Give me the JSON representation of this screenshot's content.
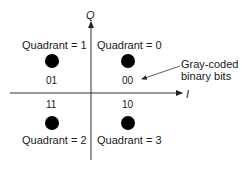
{
  "diagram": {
    "axes": {
      "vertical": "Q",
      "horizontal": "I"
    },
    "points": [
      {
        "quadrant_label": "Quadrant = 1",
        "bits": "01"
      },
      {
        "quadrant_label": "Quadrant = 0",
        "bits": "00"
      },
      {
        "quadrant_label": "Quadrant = 2",
        "bits": "11"
      },
      {
        "quadrant_label": "Quadrant = 3",
        "bits": "10"
      }
    ],
    "annotation": {
      "line1": "Gray-coded",
      "line2": "binary bits"
    }
  }
}
